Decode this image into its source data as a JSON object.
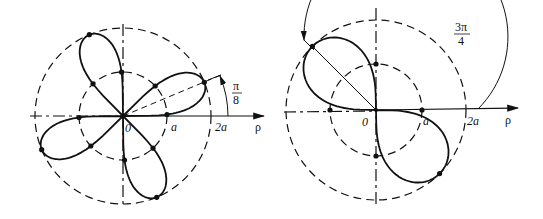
{
  "figures": [
    {
      "id": "left",
      "description": "Four-petal polar curve with petals at pi/8 + k*pi/2",
      "center": [
        123,
        116
      ],
      "inner_radius": 44,
      "outer_radius": 88,
      "labels": {
        "origin": "0",
        "inner_tick": "a",
        "outer_tick": "2a",
        "axis": "ρ",
        "angle_num": "π",
        "angle_den": "8"
      },
      "angle_deg": 22.5,
      "petal_count": 4
    },
    {
      "id": "right",
      "description": "Two-lobe polar curve with lobes along 3pi/4 direction",
      "center": [
        376,
        110
      ],
      "inner_radius": 46,
      "outer_radius": 90,
      "labels": {
        "origin": "0",
        "inner_tick": "a",
        "outer_tick": "2a",
        "axis": "ρ",
        "angle_num": "3π",
        "angle_den": "4"
      },
      "angle_deg": 135,
      "petal_count": 2
    }
  ]
}
